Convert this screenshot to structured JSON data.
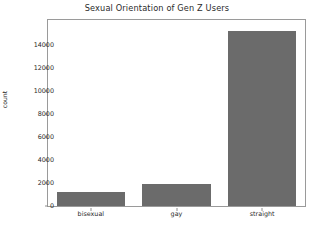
{
  "chart_data": {
    "type": "bar",
    "title": "Sexual Orientation of Gen Z Users",
    "xlabel": "",
    "ylabel": "count",
    "categories": [
      "bisexual",
      "gay",
      "straight"
    ],
    "values": [
      1250,
      1880,
      15200
    ],
    "ylim": [
      0,
      16150
    ],
    "yticks": [
      0,
      2000,
      4000,
      6000,
      8000,
      10000,
      12000,
      14000
    ],
    "ytick_labels": [
      "0",
      "2000",
      "4000",
      "6000",
      "8000",
      "10000",
      "12000",
      "14000"
    ],
    "grid": false,
    "legend": null,
    "bar_color": "#6b6b6b",
    "frame_color": "#9a9a9a",
    "text_color": "#2b2b2b",
    "background": "#ffffff"
  }
}
